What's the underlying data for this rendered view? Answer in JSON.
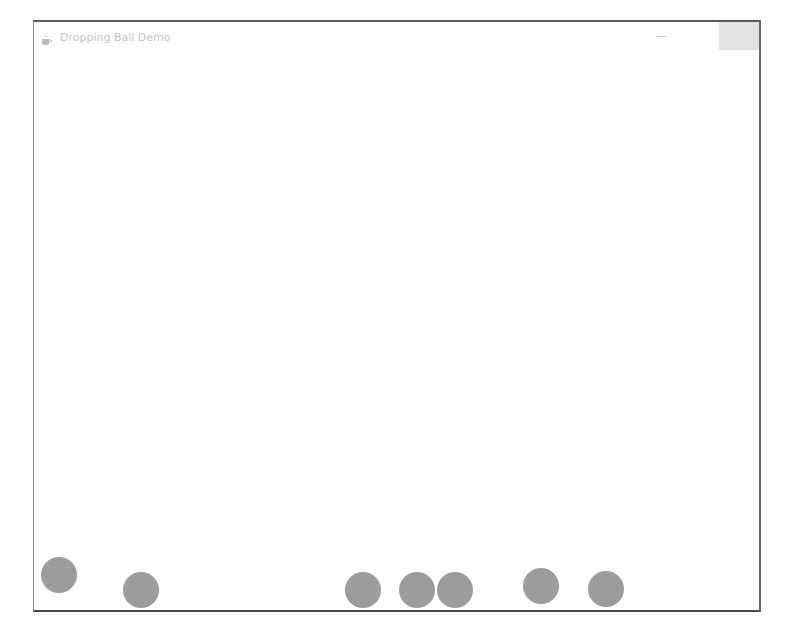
{
  "window": {
    "title": "Dropping Ball Demo",
    "icon": "java-cup-icon",
    "controls": {
      "minimize": "minimize-icon",
      "maximize": "maximize-icon",
      "close": "close-icon"
    }
  },
  "canvas": {
    "ball_color": "#9c9c9c",
    "ball_diameter": 36,
    "balls": [
      {
        "cx": 59,
        "cy": 575
      },
      {
        "cx": 141,
        "cy": 590
      },
      {
        "cx": 363,
        "cy": 590
      },
      {
        "cx": 417,
        "cy": 590
      },
      {
        "cx": 455,
        "cy": 590
      },
      {
        "cx": 541,
        "cy": 586
      },
      {
        "cx": 606,
        "cy": 589
      }
    ]
  }
}
